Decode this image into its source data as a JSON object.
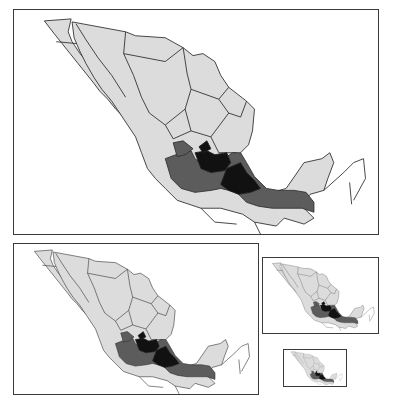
{
  "figure": {
    "legend": {
      "light": "#dcdcdc",
      "medium": "#5c5c5c",
      "dark": "#111111"
    },
    "panels": [
      {
        "id": "large",
        "scale": "1.0"
      },
      {
        "id": "medium",
        "scale": "0.67"
      },
      {
        "id": "small",
        "scale": "0.32"
      },
      {
        "id": "smallest",
        "scale": "0.17"
      }
    ]
  }
}
